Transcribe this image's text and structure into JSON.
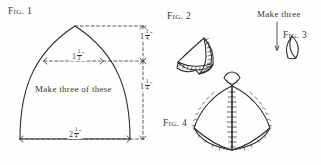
{
  "diagram": {
    "title_figures": [
      "Fig. 1",
      "Fig. 2",
      "Fig. 3",
      "Fig. 4"
    ],
    "ink_color": "#2a2622",
    "paper_color": "#fefefe"
  },
  "fig1": {
    "label": "Fig. 1",
    "instruction": "Make three of these",
    "dimensions": {
      "mid_width": {
        "whole": "1",
        "numerator": "1",
        "denominator": "2",
        "unit": "\""
      },
      "bottom_width": {
        "whole": "2",
        "numerator": "1",
        "denominator": "4",
        "unit": "\""
      },
      "upper_height": {
        "whole": "1",
        "numerator": "1",
        "denominator": "4",
        "unit": "\""
      },
      "lower_height": {
        "whole": "1",
        "numerator": "1",
        "denominator": "4",
        "unit": "\""
      }
    }
  },
  "fig2": {
    "label": "Fig. 2"
  },
  "fig3": {
    "label": "Fig. 3",
    "instruction": "Make three"
  },
  "fig4": {
    "label": "Fig. 4"
  }
}
